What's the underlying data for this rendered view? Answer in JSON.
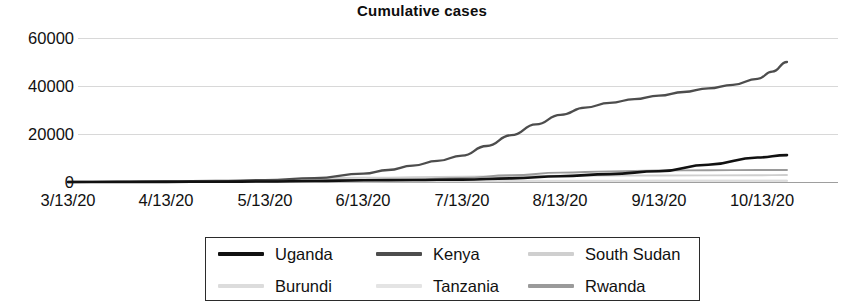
{
  "chart_data": {
    "type": "line",
    "title": "Cumulative cases",
    "xlabel": "",
    "ylabel": "",
    "grid": true,
    "legend_position": "bottom",
    "ylim": [
      0,
      60000
    ],
    "yticks": [
      0,
      20000,
      40000,
      60000
    ],
    "ytick_labels": [
      "0",
      "20000",
      "40000",
      "60000"
    ],
    "x": [
      "3/13/20",
      "4/13/20",
      "5/13/20",
      "6/13/20",
      "7/13/20",
      "8/13/20",
      "9/13/20",
      "10/13/20"
    ],
    "xtick_labels": [
      "3/13/20",
      "4/13/20",
      "5/13/20",
      "6/13/20",
      "7/13/20",
      "8/13/20",
      "9/13/20",
      "10/13/20"
    ],
    "series": [
      {
        "name": "Uganda",
        "color": "#111111",
        "values": [
          0,
          60,
          200,
          700,
          1000,
          2400,
          4500,
          11000
        ],
        "points": [
          [
            0,
            0
          ],
          [
            0.5,
            30
          ],
          [
            1,
            60
          ],
          [
            1.5,
            120
          ],
          [
            2,
            200
          ],
          [
            2.5,
            400
          ],
          [
            3,
            700
          ],
          [
            3.5,
            850
          ],
          [
            4,
            1000
          ],
          [
            4.5,
            1500
          ],
          [
            5,
            2400
          ],
          [
            5.5,
            3300
          ],
          [
            6,
            4500
          ],
          [
            6.5,
            7200
          ],
          [
            7,
            10200
          ],
          [
            7.3,
            11200
          ]
        ]
      },
      {
        "name": "Kenya",
        "color": "#4d4d4d",
        "values": [
          0,
          200,
          800,
          3500,
          11000,
          34000,
          40000,
          50000
        ],
        "points": [
          [
            0,
            0
          ],
          [
            0.5,
            60
          ],
          [
            1,
            200
          ],
          [
            1.5,
            400
          ],
          [
            2,
            800
          ],
          [
            2.5,
            1600
          ],
          [
            3,
            3500
          ],
          [
            3.25,
            5000
          ],
          [
            3.5,
            6800
          ],
          [
            3.75,
            8800
          ],
          [
            4,
            11000
          ],
          [
            4.25,
            15000
          ],
          [
            4.5,
            19500
          ],
          [
            4.75,
            24000
          ],
          [
            5,
            28000
          ],
          [
            5.25,
            31000
          ],
          [
            5.5,
            33000
          ],
          [
            5.75,
            34500
          ],
          [
            6,
            36000
          ],
          [
            6.25,
            37500
          ],
          [
            6.5,
            39000
          ],
          [
            6.75,
            40500
          ],
          [
            7,
            43000
          ],
          [
            7.15,
            46000
          ],
          [
            7.3,
            50000
          ]
        ]
      },
      {
        "name": "South Sudan",
        "color": "#cfcfcf",
        "values": [
          0,
          50,
          600,
          1800,
          2200,
          2600,
          2700,
          2900
        ],
        "points": [
          [
            0,
            0
          ],
          [
            1,
            50
          ],
          [
            2,
            600
          ],
          [
            3,
            1800
          ],
          [
            4,
            2200
          ],
          [
            5,
            2600
          ],
          [
            6,
            2700
          ],
          [
            7,
            2850
          ],
          [
            7.3,
            2900
          ]
        ]
      },
      {
        "name": "Burundi",
        "color": "#dcdcdc",
        "values": [
          0,
          20,
          100,
          200,
          350,
          450,
          500,
          550
        ],
        "points": [
          [
            0,
            0
          ],
          [
            1,
            20
          ],
          [
            2,
            100
          ],
          [
            3,
            200
          ],
          [
            4,
            350
          ],
          [
            5,
            450
          ],
          [
            6,
            500
          ],
          [
            7,
            540
          ],
          [
            7.3,
            550
          ]
        ]
      },
      {
        "name": "Tanzania",
        "color": "#e4e4e4",
        "values": [
          0,
          100,
          500,
          509,
          509,
          509,
          509,
          509
        ],
        "points": [
          [
            0,
            0
          ],
          [
            1,
            100
          ],
          [
            2,
            500
          ],
          [
            3,
            509
          ],
          [
            4,
            509
          ],
          [
            5,
            509
          ],
          [
            6,
            509
          ],
          [
            7,
            509
          ],
          [
            7.3,
            509
          ]
        ]
      },
      {
        "name": "Rwanda",
        "color": "#9a9a9a",
        "values": [
          0,
          120,
          280,
          700,
          1700,
          3900,
          4800,
          5000
        ],
        "points": [
          [
            0,
            0
          ],
          [
            1,
            120
          ],
          [
            2,
            280
          ],
          [
            3,
            700
          ],
          [
            3.5,
            1100
          ],
          [
            4,
            1700
          ],
          [
            4.5,
            2800
          ],
          [
            5,
            3900
          ],
          [
            5.5,
            4400
          ],
          [
            6,
            4800
          ],
          [
            6.5,
            4900
          ],
          [
            7,
            4980
          ],
          [
            7.3,
            5000
          ]
        ]
      }
    ]
  }
}
